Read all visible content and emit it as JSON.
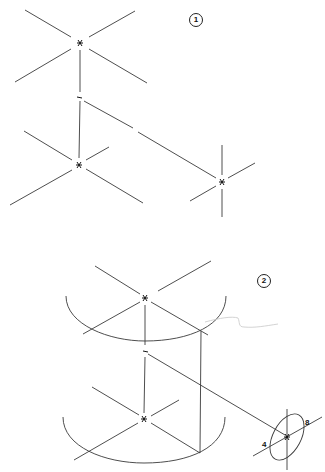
{
  "figure": {
    "type": "isometric construction drawing",
    "colors": {
      "line": "#3a3a3a",
      "background": "#ffffff",
      "faint": "#c8c8c8"
    },
    "steps": [
      {
        "id": "step-1",
        "badge": "1"
      },
      {
        "id": "step-2",
        "badge": "2"
      }
    ],
    "ellipse_labels": {
      "minor": "4",
      "major": "8"
    }
  }
}
